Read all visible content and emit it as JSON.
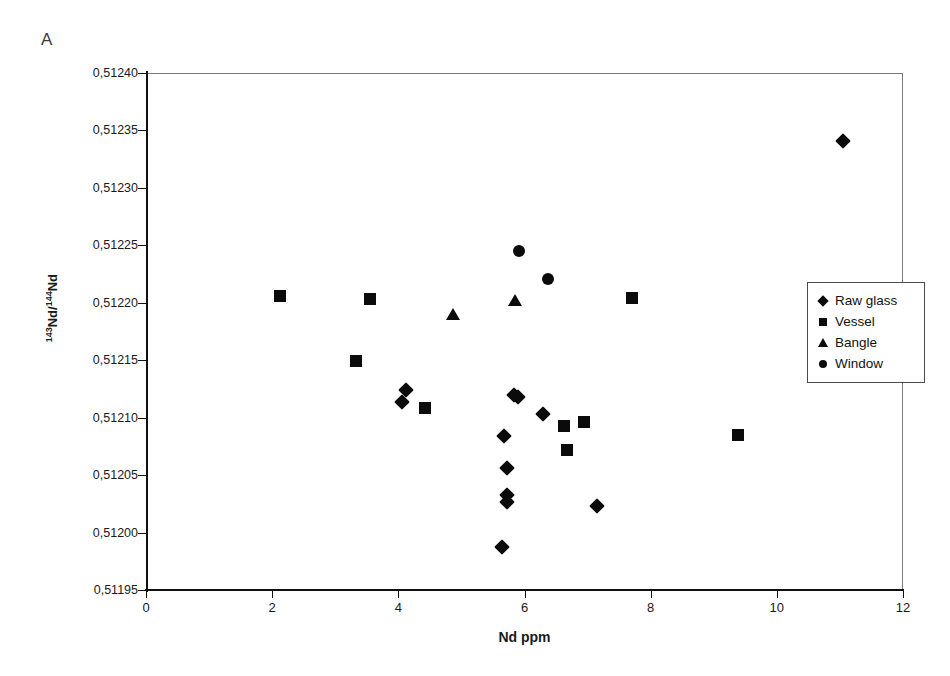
{
  "panel": {
    "label": "A"
  },
  "legend": {
    "entries": [
      {
        "label": "Raw glass",
        "marker": "diamond"
      },
      {
        "label": "Vessel",
        "marker": "square"
      },
      {
        "label": "Bangle",
        "marker": "triangle"
      },
      {
        "label": "Window",
        "marker": "circle"
      }
    ]
  },
  "axes": {
    "x": {
      "label": "Nd ppm",
      "min": 0,
      "max": 12,
      "ticks": [
        0,
        2,
        4,
        6,
        8,
        10,
        12
      ],
      "tick_labels": [
        "0",
        "2",
        "4",
        "6",
        "8",
        "10",
        "12"
      ]
    },
    "y": {
      "label_html": "<sup>143</sup>Nd/<sup>144</sup>Nd",
      "label_plain": "143Nd/144Nd",
      "min": 0.51195,
      "max": 0.5124,
      "ticks": [
        0.51195,
        0.512,
        0.51205,
        0.5121,
        0.51215,
        0.5122,
        0.51225,
        0.5123,
        0.51235,
        0.5124
      ],
      "tick_labels": [
        "0,51195",
        "0,51200",
        "0,51205",
        "0,51210",
        "0,51215",
        "0,51220",
        "0,51225",
        "0,51230",
        "0,51235",
        "0,51240"
      ]
    }
  },
  "chart_data": {
    "type": "scatter",
    "title": "A",
    "xlabel": "Nd ppm",
    "ylabel": "143Nd/144Nd",
    "xlim": [
      0,
      12
    ],
    "ylim": [
      0.51195,
      0.5124
    ],
    "grid": false,
    "legend_position": "right-middle",
    "series": [
      {
        "name": "Raw glass",
        "marker": "diamond",
        "color": "#0b0b0b",
        "points": [
          {
            "x": 11.05,
            "y": 0.512341
          },
          {
            "x": 4.12,
            "y": 0.512124
          },
          {
            "x": 4.06,
            "y": 0.512114
          },
          {
            "x": 5.83,
            "y": 0.51212
          },
          {
            "x": 5.9,
            "y": 0.512118
          },
          {
            "x": 6.3,
            "y": 0.512103
          },
          {
            "x": 5.68,
            "y": 0.512084
          },
          {
            "x": 5.72,
            "y": 0.512056
          },
          {
            "x": 5.73,
            "y": 0.512033
          },
          {
            "x": 5.73,
            "y": 0.512027
          },
          {
            "x": 7.15,
            "y": 0.512023
          },
          {
            "x": 5.65,
            "y": 0.511987
          }
        ]
      },
      {
        "name": "Vessel",
        "marker": "square",
        "color": "#0b0b0b",
        "points": [
          {
            "x": 2.12,
            "y": 0.512206
          },
          {
            "x": 3.55,
            "y": 0.512203
          },
          {
            "x": 7.7,
            "y": 0.512204
          },
          {
            "x": 3.33,
            "y": 0.512149
          },
          {
            "x": 4.42,
            "y": 0.512108
          },
          {
            "x": 6.62,
            "y": 0.512093
          },
          {
            "x": 6.95,
            "y": 0.512096
          },
          {
            "x": 6.68,
            "y": 0.512072
          },
          {
            "x": 9.38,
            "y": 0.512085
          }
        ]
      },
      {
        "name": "Bangle",
        "marker": "triangle",
        "color": "#0b0b0b",
        "points": [
          {
            "x": 4.86,
            "y": 0.51219
          },
          {
            "x": 5.85,
            "y": 0.512202
          }
        ]
      },
      {
        "name": "Window",
        "marker": "circle",
        "color": "#0b0b0b",
        "points": [
          {
            "x": 5.92,
            "y": 0.512245
          },
          {
            "x": 6.38,
            "y": 0.512221
          }
        ]
      }
    ]
  }
}
